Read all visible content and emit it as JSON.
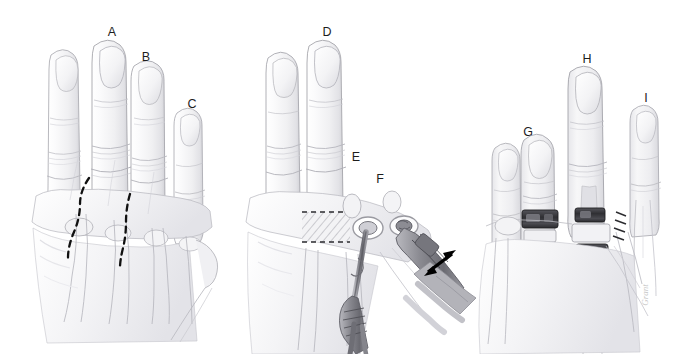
{
  "figure": {
    "background_color": "#ffffff",
    "style": "graphite pencil medical illustration",
    "width": 684,
    "height": 354,
    "artist_signature": "Grant"
  },
  "palette": {
    "background": "#ffffff",
    "outline": "#8e8e92",
    "outline_light": "#b9b9be",
    "shading_light": "#efefef",
    "shading_mid": "#d8d8dc",
    "shading_dark": "#b0b0b6",
    "incision_line": "#111111",
    "arrow": "#000000",
    "implant_dark": "#3a3a3e",
    "implant_mid": "#6e6e74",
    "instrument": "#7c7c82",
    "label_text": "#1d1d1d",
    "signature": "#c9c9c9"
  },
  "panels": [
    {
      "id": "panel-a",
      "name": "incision-planning",
      "caption": "Dorsal hand with planned longitudinal incisions",
      "labels": [
        {
          "key": "A",
          "text": "A",
          "x": 112,
          "y": 33
        },
        {
          "key": "B",
          "text": "B",
          "x": 146,
          "y": 58
        },
        {
          "key": "C",
          "text": "C",
          "x": 192,
          "y": 105
        }
      ]
    },
    {
      "id": "panel-b",
      "name": "resection-and-canal-preparation",
      "caption": "Metacarpal head resection and intramedullary canal broaching",
      "labels": [
        {
          "key": "D",
          "text": "D",
          "x": 327,
          "y": 33
        },
        {
          "key": "E",
          "text": "E",
          "x": 356,
          "y": 158
        },
        {
          "key": "F",
          "text": "F",
          "x": 380,
          "y": 180
        }
      ]
    },
    {
      "id": "panel-c",
      "name": "implants-in-place",
      "caption": "Prosthetic components seated at the metacarpophalangeal joints",
      "labels": [
        {
          "key": "G",
          "text": "G",
          "x": 528,
          "y": 133
        },
        {
          "key": "H",
          "text": "H",
          "x": 587,
          "y": 60
        },
        {
          "key": "I",
          "text": "I",
          "x": 646,
          "y": 99
        }
      ]
    }
  ],
  "annotations": {
    "incision_lines": {
      "name": "dashed-incision-lines",
      "count": 2,
      "color": "#111111",
      "style": "dashed curved"
    },
    "resection_block": {
      "name": "hatched-resection-block",
      "description": "cross-hatched rectangle marking the bone segment to be removed",
      "x": 302,
      "y": 212,
      "width": 48,
      "height": 30
    },
    "motion_arrow": {
      "name": "double-headed-arrow",
      "description": "double-headed arrow indicating instrument travel direction",
      "color": "#000000",
      "x1": 424,
      "y1": 274,
      "x2": 456,
      "y2": 252
    },
    "instruments": [
      {
        "name": "bone-awl",
        "description": "awl / broach inserted into metacarpal canal"
      },
      {
        "name": "rasp-handle",
        "description": "second instrument with handle at lower right"
      }
    ],
    "implants": [
      {
        "name": "implant-proximal-ring",
        "finger": "G",
        "color": "#3a3a3e"
      },
      {
        "name": "implant-distal-ring",
        "finger": "G",
        "color": "#3a3a3e"
      },
      {
        "name": "implant-proximal-ring",
        "finger": "H",
        "color": "#3a3a3e"
      },
      {
        "name": "implant-distal-ring",
        "finger": "H",
        "color": "#3a3a3e"
      }
    ]
  }
}
